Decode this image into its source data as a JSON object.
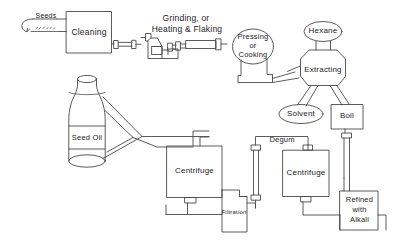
{
  "diagram": {
    "background_color": "#ffffff",
    "line_color": "#4a4a4a",
    "text_color": "#1b1b1b",
    "style": "hand-drawn process flow",
    "nodes": [
      {
        "id": "seeds",
        "label": "Seeds",
        "shape": "annotation-arrow"
      },
      {
        "id": "cleaning",
        "label": "Cleaning",
        "shape": "rectangle"
      },
      {
        "id": "grinding",
        "label": "Grinding, or\nHeating & Flaking",
        "label_line1": "Grinding, or",
        "label_line2": "Heating & Flaking",
        "shape": "machinery-label"
      },
      {
        "id": "pressing",
        "label": "Pressing\nor\nCooking",
        "label_line1": "Pressing",
        "label_line2": "or",
        "label_line3": "Cooking",
        "shape": "ellipse"
      },
      {
        "id": "hexane",
        "label": "Hexane",
        "shape": "ellipse"
      },
      {
        "id": "extracting",
        "label": "Extracting",
        "shape": "vessel"
      },
      {
        "id": "solvent",
        "label": "Solvent",
        "shape": "ellipse"
      },
      {
        "id": "boil",
        "label": "Boil",
        "shape": "rectangle"
      },
      {
        "id": "degum",
        "label": "Degum",
        "shape": "pipe-label"
      },
      {
        "id": "centrifuge_right",
        "label": "Centrifuge",
        "shape": "rectangle"
      },
      {
        "id": "refined",
        "label": "Refined\nwith\nAlkali",
        "label_line1": "Refined",
        "label_line2": "with",
        "label_line3": "Alkali",
        "shape": "rectangle"
      },
      {
        "id": "centrifuge_left",
        "label": "Centrifuge",
        "shape": "rectangle"
      },
      {
        "id": "filtration",
        "label": "Filtration",
        "shape": "polygon"
      },
      {
        "id": "seed_oil",
        "label": "Seed Oil",
        "shape": "bottle"
      }
    ]
  }
}
